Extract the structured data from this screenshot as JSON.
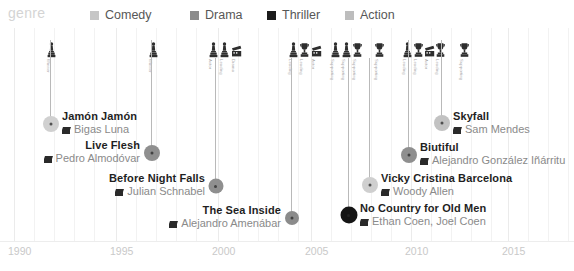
{
  "legend": {
    "title": "genre",
    "items": [
      {
        "label": "Comedy",
        "color": "#c6c6c6",
        "x": 90
      },
      {
        "label": "Drama",
        "color": "#8c8c8c",
        "x": 190
      },
      {
        "label": "Thriller",
        "color": "#1c1c1c",
        "x": 267
      },
      {
        "label": "Action",
        "color": "#bdbdbd",
        "x": 345
      }
    ]
  },
  "axis": {
    "label": "year",
    "ticks": [
      {
        "label": "1990",
        "x": 8
      },
      {
        "label": "1995",
        "x": 110
      },
      {
        "label": "2000",
        "x": 212
      },
      {
        "label": "2005",
        "x": 305
      },
      {
        "label": "2010",
        "x": 405
      },
      {
        "label": "2015",
        "x": 502
      }
    ],
    "gridlines": [
      14,
      34,
      54,
      74,
      94,
      116,
      136,
      156,
      176,
      196,
      218,
      238,
      258,
      278,
      298,
      311,
      331,
      351,
      371,
      391,
      411,
      431,
      451,
      471,
      491,
      508,
      528,
      548,
      568
    ],
    "major_gridlines": [
      14,
      116,
      218,
      311,
      411,
      508
    ]
  },
  "chart_data": {
    "type": "timeline",
    "title": "genre",
    "xlabel": "year",
    "xlim": [
      1990,
      2016
    ],
    "legend_position": "top",
    "grid": true,
    "color_by": "genre",
    "events": [
      {
        "title": "Jamón Jamón",
        "director": "Bigas Luna",
        "year": 1992,
        "genre": "Comedy",
        "color": "#d0d0d0",
        "dot_x": 50,
        "dot_y": 124,
        "dot_size": 16,
        "stem_top": 40,
        "label_side": "right",
        "label_x": 62,
        "label_y": 110
      },
      {
        "title": "Live Flesh",
        "director": "Pedro Almodóvar",
        "year": 1997,
        "genre": "Drama",
        "color": "#8f8f8f",
        "dot_x": 151,
        "dot_y": 153,
        "dot_size": 16,
        "stem_top": 40,
        "label_side": "left",
        "label_x": 140,
        "label_y": 139
      },
      {
        "title": "Before Night Falls",
        "director": "Julian Schnabel",
        "year": 2000,
        "genre": "Drama",
        "color": "#8f8f8f",
        "dot_x": 215,
        "dot_y": 186,
        "dot_size": 15,
        "stem_top": 58,
        "label_side": "left",
        "label_x": 205,
        "label_y": 172
      },
      {
        "title": "The Sea Inside",
        "director": "Alejandro Amenábar",
        "year": 2004,
        "genre": "Drama",
        "color": "#8b8b8b",
        "dot_x": 291,
        "dot_y": 218,
        "dot_size": 14,
        "stem_top": 58,
        "label_side": "left",
        "label_x": 281,
        "label_y": 204
      },
      {
        "title": "No Country for Old Men",
        "director": "Ethan Coen, Joel Coen",
        "year": 2007,
        "genre": "Thriller",
        "color": "#151515",
        "dot_x": 348,
        "dot_y": 215,
        "dot_size": 17,
        "stem_top": 58,
        "label_side": "right",
        "label_x": 360,
        "label_y": 202
      },
      {
        "title": "Vicky Cristina Barcelona",
        "director": "Woody Allen",
        "year": 2008,
        "genre": "Comedy",
        "color": "#cfcfcf",
        "dot_x": 369,
        "dot_y": 185,
        "dot_size": 16,
        "stem_top": 58,
        "label_side": "right",
        "label_x": 381,
        "label_y": 172
      },
      {
        "title": "Biutiful",
        "director": "Alejandro González Iñárritu",
        "year": 2010,
        "genre": "Drama",
        "color": "#8f8f8f",
        "dot_x": 408,
        "dot_y": 155,
        "dot_size": 16,
        "stem_top": 40,
        "label_side": "right",
        "label_x": 420,
        "label_y": 141
      },
      {
        "title": "Skyfall",
        "director": "Sam Mendes",
        "year": 2012,
        "genre": "Action",
        "color": "#c2c2c2",
        "dot_x": 441,
        "dot_y": 123,
        "dot_size": 16,
        "stem_top": 40,
        "label_side": "right",
        "label_x": 453,
        "label_y": 110
      }
    ],
    "awards": [
      {
        "x": 46,
        "y": 42,
        "glyph": "statuette",
        "caption": "Winner"
      },
      {
        "x": 148,
        "y": 42,
        "glyph": "statuette",
        "caption": "Winner"
      },
      {
        "x": 208,
        "y": 42,
        "glyph": "statuette",
        "caption": "Actor"
      },
      {
        "x": 219,
        "y": 42,
        "glyph": "statuette",
        "caption": "Leading"
      },
      {
        "x": 231,
        "y": 42,
        "glyph": "masks",
        "caption": "Drama"
      },
      {
        "x": 288,
        "y": 42,
        "glyph": "statuette",
        "caption": "Leading"
      },
      {
        "x": 299,
        "y": 42,
        "glyph": "trophy",
        "caption": "Leading"
      },
      {
        "x": 311,
        "y": 42,
        "glyph": "masks",
        "caption": "Actor"
      },
      {
        "x": 330,
        "y": 42,
        "glyph": "statuette",
        "caption": "Supporting"
      },
      {
        "x": 341,
        "y": 42,
        "glyph": "statuette",
        "caption": "Supporting"
      },
      {
        "x": 352,
        "y": 42,
        "glyph": "trophy",
        "caption": "Supporting"
      },
      {
        "x": 374,
        "y": 42,
        "glyph": "trophy",
        "caption": "Supporting"
      },
      {
        "x": 402,
        "y": 42,
        "glyph": "statuette",
        "caption": "Leading"
      },
      {
        "x": 413,
        "y": 42,
        "glyph": "trophy",
        "caption": "Leading"
      },
      {
        "x": 424,
        "y": 42,
        "glyph": "masks",
        "caption": "Actor"
      },
      {
        "x": 435,
        "y": 42,
        "glyph": "trophy",
        "caption": "Leading"
      },
      {
        "x": 459,
        "y": 42,
        "glyph": "trophy",
        "caption": "Supporting"
      }
    ]
  }
}
